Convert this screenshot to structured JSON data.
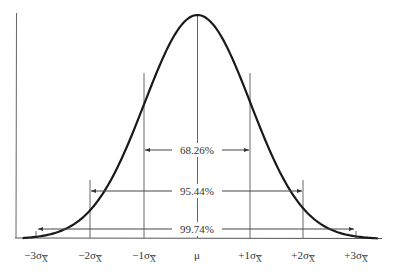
{
  "chart_data": {
    "type": "line",
    "title": "",
    "xlabel": "",
    "ylabel": "",
    "x_ticks": [
      "−3σx̄",
      "−2σx̄",
      "−1σx̄",
      "μ",
      "+1σx̄",
      "+2σx̄",
      "+3σx̄"
    ],
    "x_tick_values": [
      -3,
      -2,
      -1,
      0,
      1,
      2,
      3
    ],
    "curve": "standard normal density",
    "xlim": [
      -3.3,
      3.4
    ],
    "grid": false,
    "legend": null,
    "annotations": [
      {
        "label": "68.26%",
        "from": -1,
        "to": 1
      },
      {
        "label": "95.44%",
        "from": -2,
        "to": 2
      },
      {
        "label": "99.74%",
        "from": -3,
        "to": 3
      }
    ]
  },
  "labels": {
    "ticks": [
      {
        "prefix": "−3σ",
        "sub": "X"
      },
      {
        "prefix": "−2σ",
        "sub": "X"
      },
      {
        "prefix": "−1σ",
        "sub": "X"
      },
      {
        "prefix": "μ",
        "sub": ""
      },
      {
        "prefix": "+1σ",
        "sub": "X"
      },
      {
        "prefix": "+2σ",
        "sub": "X"
      },
      {
        "prefix": "+3σ",
        "sub": "X"
      }
    ],
    "a1": "68.26%",
    "a2": "95.44%",
    "a3": "99.74%"
  },
  "colors": {
    "curve": "#1a1a1a",
    "lines": "#555555",
    "text": "#333333"
  }
}
